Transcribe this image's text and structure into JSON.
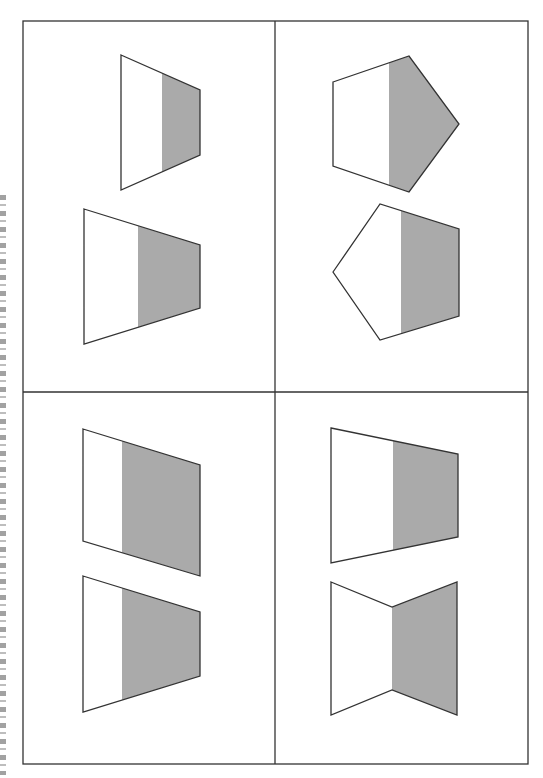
{
  "figure": {
    "colors": {
      "frame": "#333333",
      "shade": "#aaaaaa",
      "fill": "#ffffff",
      "background": "#ffffff"
    },
    "frame": {
      "x": 23,
      "y": 21,
      "width": 505,
      "height": 743,
      "divider_x": 275,
      "divider_y": 392
    },
    "margin_text": {
      "visible": true,
      "legible": false,
      "orientation": "rotated-vertical",
      "clipped": true
    },
    "quadrants": [
      {
        "position": "top-left",
        "shapes": [
          {
            "type": "trapezoid",
            "points": [
              [
                121,
                55
              ],
              [
                200,
                90
              ],
              [
                200,
                155
              ],
              [
                121,
                190
              ]
            ],
            "shade_x": 162
          },
          {
            "type": "trapezoid",
            "points": [
              [
                84,
                209
              ],
              [
                200,
                245
              ],
              [
                200,
                308
              ],
              [
                84,
                344
              ]
            ],
            "shade_x": 138
          }
        ]
      },
      {
        "position": "top-right",
        "shapes": [
          {
            "type": "pentagon",
            "points": [
              [
                333,
                82
              ],
              [
                409,
                56
              ],
              [
                459,
                124
              ],
              [
                409,
                192
              ],
              [
                333,
                166
              ]
            ],
            "shade_x": 389
          },
          {
            "type": "pentagon",
            "points": [
              [
                333,
                272
              ],
              [
                380,
                204
              ],
              [
                459,
                229
              ],
              [
                459,
                316
              ],
              [
                380,
                340
              ]
            ],
            "shade_x": 401
          }
        ]
      },
      {
        "position": "bottom-left",
        "shapes": [
          {
            "type": "parallelogram",
            "points": [
              [
                83,
                429
              ],
              [
                200,
                465
              ],
              [
                200,
                576
              ],
              [
                83,
                541
              ]
            ],
            "shade_x": 122
          },
          {
            "type": "trapezoid",
            "points": [
              [
                83,
                576
              ],
              [
                200,
                612
              ],
              [
                200,
                676
              ],
              [
                83,
                712
              ]
            ],
            "shade_x": 122
          }
        ]
      },
      {
        "position": "bottom-right",
        "shapes": [
          {
            "type": "trapezoid",
            "points": [
              [
                331,
                428
              ],
              [
                458,
                454
              ],
              [
                458,
                537
              ],
              [
                331,
                563
              ]
            ],
            "shade_x": 393
          },
          {
            "type": "concave-hexagon",
            "points": [
              [
                331,
                582
              ],
              [
                392,
                607
              ],
              [
                457,
                582
              ],
              [
                457,
                715
              ],
              [
                392,
                690
              ],
              [
                331,
                715
              ]
            ],
            "shade_x": 392
          }
        ]
      }
    ]
  }
}
